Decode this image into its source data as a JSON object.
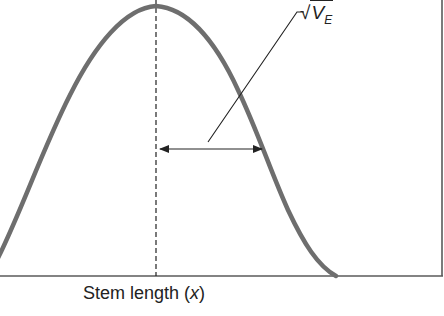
{
  "figure": {
    "type": "diagram",
    "x_axis_label": "Stem length",
    "x_axis_variable": "x",
    "annotation": {
      "radical_symbol": "√",
      "label_main": "V",
      "label_subscript": "E"
    },
    "colors": {
      "curve": "#6e6e6e",
      "axis": "#5a5a5a",
      "lines": "#222222"
    },
    "geometry": {
      "peak": [
        156,
        6
      ],
      "baseline_y": 276,
      "curve_right_end": [
        336,
        276
      ],
      "mean_line_x": 156,
      "sd_arrow": {
        "y": 149,
        "x_start": 158,
        "x_end": 262
      },
      "leader_line": {
        "from": [
          208,
          142
        ],
        "to": [
          298,
          12
        ],
        "tick_end": [
          304,
          12
        ]
      }
    }
  }
}
